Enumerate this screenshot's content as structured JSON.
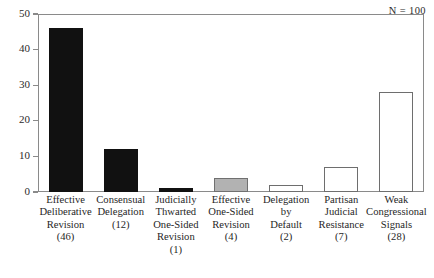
{
  "chart_data": {
    "type": "bar",
    "title": "",
    "xlabel": "",
    "ylabel": "",
    "ylim": [
      0,
      50
    ],
    "yticks": [
      0,
      10,
      20,
      30,
      40,
      50
    ],
    "grid": false,
    "legend": null,
    "annotation": "N = 100",
    "categories": [
      "Effective Deliberative Revision",
      "Consensual Delegation",
      "Judicially Thwarted One-Sided Revision",
      "Effective One-Sided Revision",
      "Delegation by Default",
      "Partisan Judicial Resistance",
      "Weak Congressional Signals"
    ],
    "values": [
      46,
      12,
      1,
      4,
      2,
      7,
      28
    ],
    "bars": [
      {
        "value": 46,
        "fill": "black",
        "count_label": "(46)",
        "label_lines": [
          "Effective",
          "Deliberative",
          "Revision",
          "(46)"
        ]
      },
      {
        "value": 12,
        "fill": "black",
        "count_label": "(12)",
        "label_lines": [
          "Consensual",
          "Delegation",
          "(12)"
        ]
      },
      {
        "value": 1,
        "fill": "black",
        "count_label": "(1)",
        "label_lines": [
          "Judicially",
          "Thwarted",
          "One-Sided",
          "Revision",
          "(1)"
        ]
      },
      {
        "value": 4,
        "fill": "gray",
        "count_label": "(4)",
        "label_lines": [
          "Effective",
          "One-Sided",
          "Revision",
          "(4)"
        ]
      },
      {
        "value": 2,
        "fill": "white",
        "count_label": "(2)",
        "label_lines": [
          "Delegation",
          "by",
          "Default",
          "(2)"
        ]
      },
      {
        "value": 7,
        "fill": "white",
        "count_label": "(7)",
        "label_lines": [
          "Partisan",
          "Judicial",
          "Resistance",
          "(7)"
        ]
      },
      {
        "value": 28,
        "fill": "white",
        "count_label": "(28)",
        "label_lines": [
          "Weak",
          "Congressional",
          "Signals",
          "(28)"
        ]
      }
    ],
    "colors": {
      "black_fill": "#111111",
      "gray_fill": "#b2b2b2",
      "white_fill": "#ffffff",
      "outline": "#6e6e6e",
      "frame": "#8a8a8a",
      "text": "#1f1f1f"
    }
  }
}
